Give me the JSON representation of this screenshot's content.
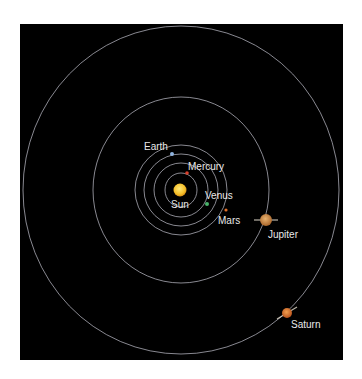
{
  "diagram": {
    "canvas": {
      "width": 362,
      "height": 379,
      "background": "#ffffff"
    },
    "panel": {
      "x": 20,
      "y": 24,
      "width": 323,
      "height": 336,
      "fill": "#000000"
    },
    "center": {
      "x": 181,
      "y": 190
    },
    "orbit_color": "#c9c9d6",
    "orbits": [
      {
        "name": "mercury-orbit",
        "rx": 16,
        "ry": 17
      },
      {
        "name": "venus-orbit",
        "rx": 27,
        "ry": 27
      },
      {
        "name": "earth-orbit",
        "rx": 37,
        "ry": 36
      },
      {
        "name": "mars-orbit",
        "rx": 46,
        "ry": 45
      },
      {
        "name": "jupiter-orbit",
        "rx": 88,
        "ry": 93
      },
      {
        "name": "saturn-orbit",
        "rx": 158,
        "ry": 164
      }
    ],
    "bodies": [
      {
        "name": "sun",
        "label": "Sun",
        "x": 180,
        "y": 190,
        "r": 6.5,
        "color": "#f5c02a",
        "label_x": 171,
        "label_y": 208
      },
      {
        "name": "mercury",
        "label": "Mercury",
        "x": 187,
        "y": 173,
        "r": 1.8,
        "color": "#d8402c",
        "label_x": 188,
        "label_y": 170
      },
      {
        "name": "venus",
        "label": "Venus",
        "x": 207,
        "y": 204,
        "r": 2,
        "color": "#49b36a",
        "label_x": 205,
        "label_y": 199
      },
      {
        "name": "earth",
        "label": "Earth",
        "x": 172,
        "y": 154,
        "r": 2,
        "color": "#8fb4e0",
        "label_x": 144,
        "label_y": 150
      },
      {
        "name": "mars",
        "label": "Mars",
        "x": 226,
        "y": 210,
        "r": 1.6,
        "color": "#e0702a",
        "label_x": 218,
        "label_y": 224
      },
      {
        "name": "jupiter",
        "label": "Jupiter",
        "x": 266,
        "y": 220,
        "r": 6,
        "color": "#c9853a",
        "label_x": 268,
        "label_y": 238,
        "ring": true
      },
      {
        "name": "saturn",
        "label": "Saturn",
        "x": 287,
        "y": 313,
        "r": 5,
        "color": "#d9702a",
        "label_x": 291,
        "label_y": 328,
        "ring": true
      }
    ]
  }
}
